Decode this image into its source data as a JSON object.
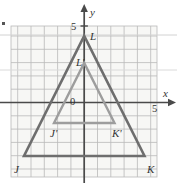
{
  "figure": {
    "grid": {
      "x_min": 11,
      "x_max": 157,
      "y_min": 26,
      "y_max": 177,
      "cell": 13.3,
      "line_color": "#b9b9b9",
      "background": "#f7f7f5"
    },
    "axes": {
      "origin_px": {
        "x": 84.2,
        "y": 102.5
      },
      "x_axis_label": "x",
      "y_axis_label": "y",
      "x_tick_label": "5",
      "y_tick_label": "5",
      "origin_label": "0",
      "axis_color": "#4a4a4a"
    },
    "outer_triangle": {
      "name": "JKL",
      "color": "#6e6e6e",
      "stroke_width": 2.6,
      "vertices": [
        {
          "label": "J",
          "px": {
            "x": 24.0,
            "y": 156.0
          }
        },
        {
          "label": "K",
          "px": {
            "x": 144.5,
            "y": 156.0
          }
        },
        {
          "label": "L",
          "px": {
            "x": 84.2,
            "y": 36.0
          }
        }
      ]
    },
    "inner_triangle": {
      "name": "J'K'L'",
      "color": "#9d9d9d",
      "stroke_width": 2.4,
      "vertices": [
        {
          "label": "J'",
          "px": {
            "x": 54.0,
            "y": 123.0
          }
        },
        {
          "label": "K'",
          "px": {
            "x": 114.5,
            "y": 123.0
          }
        },
        {
          "label": "L'",
          "px": {
            "x": 84.2,
            "y": 63.0
          }
        }
      ]
    },
    "point_labels": [
      {
        "id": "label-L",
        "text": "L",
        "x": 90,
        "y": 31,
        "style": "italic"
      },
      {
        "id": "label-Lp",
        "text": "L'",
        "x": 76,
        "y": 57,
        "style": "italic"
      },
      {
        "id": "label-Jp",
        "text": "J'",
        "x": 50,
        "y": 128,
        "style": "italic"
      },
      {
        "id": "label-Kp",
        "text": "K'",
        "x": 112,
        "y": 128,
        "style": "italic"
      },
      {
        "id": "label-J",
        "text": "J",
        "x": 14,
        "y": 164,
        "style": "italic"
      },
      {
        "id": "label-K",
        "text": "K",
        "x": 147,
        "y": 164,
        "style": "italic"
      }
    ],
    "axis_labels": [
      {
        "id": "label-y-axis",
        "text": "y",
        "x": 90,
        "y": 7,
        "style": "italic"
      },
      {
        "id": "label-x-axis",
        "text": "x",
        "x": 163,
        "y": 88,
        "style": "italic"
      },
      {
        "id": "label-y-tick-5",
        "text": "5",
        "x": 71,
        "y": 22,
        "style": "normal"
      },
      {
        "id": "label-x-tick-5",
        "text": "5",
        "x": 152,
        "y": 104,
        "style": "normal"
      },
      {
        "id": "label-origin",
        "text": "0",
        "x": 70,
        "y": 97,
        "style": "normal"
      }
    ],
    "scan_lines": [
      {
        "y": 35.0,
        "color": "#d2d2d2"
      },
      {
        "y": 70.0,
        "color": "#dadada"
      }
    ],
    "marker": {
      "x": 2,
      "y": 22
    }
  },
  "chart_data": {
    "type": "scatter",
    "xlabel": "x",
    "ylabel": "y",
    "xlim": [
      -5.5,
      5.5
    ],
    "ylim": [
      -5.6,
      5.6
    ],
    "grid": true,
    "legend": "none",
    "xtick_labels": [
      "5"
    ],
    "ytick_labels": [
      "5"
    ],
    "annotations": [
      "0",
      "x",
      "y",
      "5",
      "5"
    ],
    "series": [
      {
        "name": "Triangle JKL",
        "closed": true,
        "points": [
          {
            "label": "J",
            "x": -4.5,
            "y": -4.0
          },
          {
            "label": "K",
            "x": 4.5,
            "y": -4.0
          },
          {
            "label": "L",
            "x": 0.0,
            "y": 5.0
          }
        ]
      },
      {
        "name": "Triangle J'K'L'",
        "closed": true,
        "points": [
          {
            "label": "J'",
            "x": -2.25,
            "y": -1.5
          },
          {
            "label": "K'",
            "x": 2.25,
            "y": -1.5
          },
          {
            "label": "L'",
            "x": 0.0,
            "y": 3.0
          }
        ]
      }
    ]
  }
}
